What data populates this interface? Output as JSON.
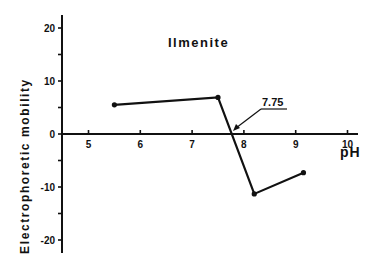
{
  "chart_data": {
    "type": "line",
    "title": "Ilmenite",
    "xlabel": "pH",
    "ylabel": "Electrophoretic  mobility",
    "xlim": [
      4.5,
      10.2
    ],
    "ylim": [
      -22,
      22
    ],
    "x_ticks": [
      5,
      6,
      7,
      8,
      9,
      10
    ],
    "x_tick_labels": [
      "5",
      "6",
      "7",
      "8",
      "9",
      "10"
    ],
    "y_ticks": [
      20,
      15,
      10,
      5,
      0,
      -5,
      -10,
      -15,
      -20
    ],
    "y_tick_labels": [
      {
        "value": 20,
        "label": "20"
      },
      {
        "value": 10,
        "label": "10"
      },
      {
        "value": 0,
        "label": "0"
      },
      {
        "value": -10,
        "label": "-10"
      },
      {
        "value": -20,
        "label": "-20"
      }
    ],
    "grid": false,
    "legend": null,
    "series": [
      {
        "name": "Ilmenite",
        "x": [
          5.5,
          7.5,
          8.2,
          9.15
        ],
        "y": [
          5.5,
          6.9,
          -11.3,
          -7.3
        ]
      }
    ],
    "annotations": [
      {
        "text": "7.75",
        "x": 7.75,
        "y": 0,
        "note": "isoelectric point (arrow to zero crossing)"
      }
    ]
  }
}
